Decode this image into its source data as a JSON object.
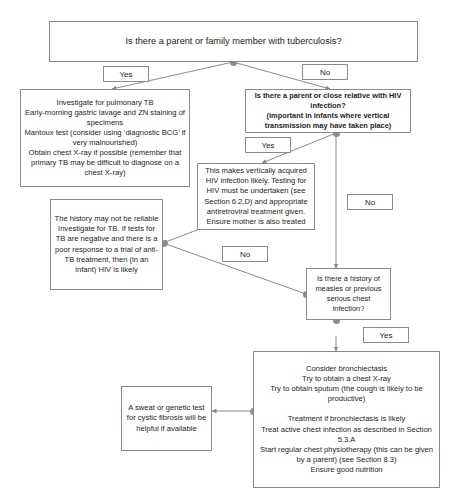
{
  "diagram": {
    "line_color": "#8a8a8a",
    "dot_color": "#8c8c8c",
    "background": "#ffffff",
    "nodes": {
      "root_question": "Is there a parent or family member with tuberculosis?",
      "investigate_tb": "Investigate for pulmonary TB\nEarly-morning gastric lavage and ZN staining of specimens\nMantoux test (consider using ‘diagnostic BCG’ if very malnourished)\nObtain chest X-ray if possible (remember that primary TB may be difficult to diagnose on a chest X-ray)",
      "hiv_question": "Is there a parent or close relative with HIV infection?\n(important in infants where vertical transmission may have taken place)",
      "vertically_acquired_hiv": "This makes vertically acquired HIV infection likely.  Testing for HIV must be undertaken (see Section 6.2.D) and appropriate antiretroviral treatment given. Ensure mother is also treated",
      "history_not_reliable": "The history may not be reliable\nInvestigate for TB.  If tests for TB are negative and there is a poor response to a trial of anti-TB treatment, then (in an infant) HIV is likely",
      "measles_question": "Is there a history of measles or previous serious chest infection?",
      "bronchiectasis": "Consider bronchiectasis\nTry to obtain a chest X-ray\nTry to obtain sputum (the cough is likely to be productive)\n\nTreatment if bronchiectasis is likely\nTreat active chest infection as described in Section 5.3.A\nStart regular chest physiotherapy (this can be given by a parent) (see Section 8.3)\nEnsure good nutrition",
      "cystic_fibrosis": "A sweat or genetic test for cystic fibrosis will be helpful if available"
    },
    "edge_labels": {
      "root_yes": "Yes",
      "root_no": "No",
      "hiv_yes": "Yes",
      "hiv_no": "No",
      "measles_no": "No",
      "measles_yes": "Yes"
    }
  }
}
